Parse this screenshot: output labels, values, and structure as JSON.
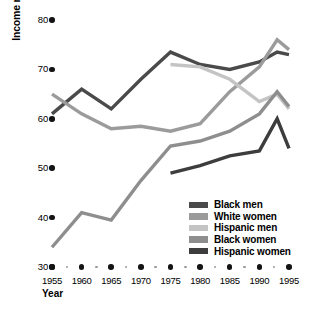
{
  "chart_data": {
    "type": "line",
    "title": "",
    "xlabel": "Year",
    "ylabel": "Income ratios (percentage of white men)",
    "xlim": [
      1955,
      1995
    ],
    "ylim": [
      30,
      80
    ],
    "yticks": [
      30,
      40,
      50,
      60,
      70,
      80
    ],
    "xticks": [
      1955,
      1960,
      1965,
      1970,
      1975,
      1980,
      1985,
      1990,
      1995
    ],
    "minor_xticks": [
      1957.5,
      1962.5,
      1967.5,
      1972.5,
      1977.5,
      1982.5,
      1987.5,
      1992.5
    ],
    "grid": false,
    "legend_position": "lower right",
    "series": [
      {
        "name": "Black men",
        "color": "#4a4a4a",
        "x": [
          1955,
          1960,
          1965,
          1970,
          1975,
          1980,
          1985,
          1990,
          1993,
          1995
        ],
        "values": [
          61.0,
          66.0,
          62.0,
          68.0,
          73.5,
          71.0,
          70.0,
          71.5,
          73.5,
          73.0
        ]
      },
      {
        "name": "White women",
        "color": "#9b9b9b",
        "x": [
          1955,
          1960,
          1965,
          1970,
          1975,
          1980,
          1985,
          1990,
          1993,
          1995
        ],
        "values": [
          65.0,
          61.0,
          58.0,
          58.5,
          57.5,
          59.0,
          65.5,
          70.5,
          76.0,
          74.0
        ]
      },
      {
        "name": "Hispanic men",
        "color": "#c4c4c4",
        "x": [
          1975,
          1980,
          1985,
          1990,
          1993,
          1995
        ],
        "values": [
          71.0,
          70.5,
          68.0,
          63.5,
          65.0,
          62.0
        ]
      },
      {
        "name": "Black women",
        "color": "#8e8e8e",
        "x": [
          1955,
          1960,
          1965,
          1970,
          1975,
          1980,
          1985,
          1990,
          1993,
          1995
        ],
        "values": [
          34.0,
          41.0,
          39.5,
          47.5,
          54.5,
          55.5,
          57.5,
          61.0,
          65.5,
          62.5
        ]
      },
      {
        "name": "Hispanic women",
        "color": "#3d3d3d",
        "x": [
          1975,
          1980,
          1985,
          1990,
          1993,
          1995
        ],
        "values": [
          49.0,
          50.5,
          52.5,
          53.5,
          60.0,
          54.0
        ]
      }
    ]
  },
  "axes": {
    "y_tick_labels": [
      "30",
      "40",
      "50",
      "60",
      "70",
      "80"
    ],
    "x_tick_labels": [
      "1955",
      "1960",
      "1965",
      "1970",
      "1975",
      "1980",
      "1985",
      "1990",
      "1995"
    ],
    "y_axis_title": "Income ratios (percentage of white men)",
    "x_axis_title": "Year"
  },
  "legend": {
    "items": [
      {
        "label": "Black men",
        "color": "#4a4a4a"
      },
      {
        "label": "White women",
        "color": "#9b9b9b"
      },
      {
        "label": "Hispanic men",
        "color": "#c4c4c4"
      },
      {
        "label": "Black women",
        "color": "#8e8e8e"
      },
      {
        "label": "Hispanic women",
        "color": "#3d3d3d"
      }
    ]
  }
}
